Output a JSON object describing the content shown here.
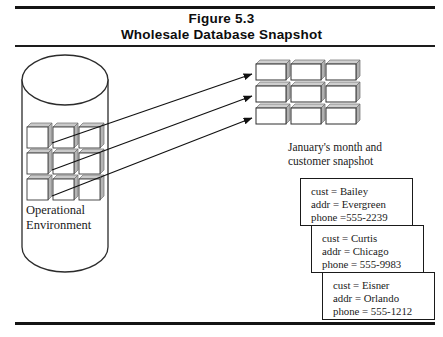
{
  "figure": {
    "title_line_1": "Figure 5.3",
    "title_line_2": "Wholesale Database Snapshot"
  },
  "operational_store": {
    "label_line_1": "Operational",
    "label_line_2": "Environment",
    "shape": "cylinder",
    "grid": {
      "rows": 3,
      "cols": 3,
      "cell_style": "3d-card"
    }
  },
  "snapshot_store": {
    "caption_line_1": "January's month and",
    "caption_line_2": "customer snapshot",
    "grid": {
      "rows": 3,
      "cols": 3,
      "cell_style": "3d-stacked-card"
    }
  },
  "arrows": {
    "count": 3,
    "direction": "operational-to-snapshot",
    "head": "filled-triangle"
  },
  "records": [
    {
      "line_1": "cust = Bailey",
      "line_2": "addr = Evergreen",
      "line_3": "phone =555-2239"
    },
    {
      "line_1": "cust = Curtis",
      "line_2": "addr = Chicago",
      "line_3": "phone = 555-9983"
    },
    {
      "line_1": "cust = Eisner",
      "line_2": "addr = Orlando",
      "line_3": "phone = 555-1212"
    }
  ],
  "colors": {
    "ink": "#1a1a1a",
    "rule": "#141414",
    "card_shadow": "#9a9a9a",
    "card_fill": "#ffffff",
    "page": "#ffffff"
  }
}
